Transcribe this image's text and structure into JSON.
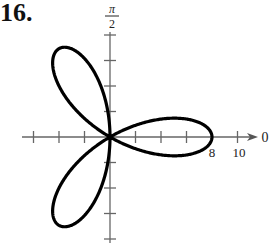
{
  "problem_number": "16.",
  "chart_data": {
    "type": "line",
    "coordinate_system": "polar",
    "equation": "r = 8 cos 3θ",
    "title": "",
    "petals": [
      {
        "angle_deg": 0,
        "length": 8
      },
      {
        "angle_deg": 120,
        "length": 8
      },
      {
        "angle_deg": 240,
        "length": 8
      }
    ],
    "axis_labels": {
      "polar_axis": "0",
      "vertical_axis": "π/2",
      "vertical_top": "π",
      "vertical_bottom": "2"
    },
    "tick_labels": [
      {
        "value": 8,
        "label": "8"
      },
      {
        "value": 10,
        "label": "10"
      }
    ],
    "tick_spacing": 2,
    "radial_range": [
      -8,
      10
    ],
    "grid": false,
    "legend": null
  }
}
